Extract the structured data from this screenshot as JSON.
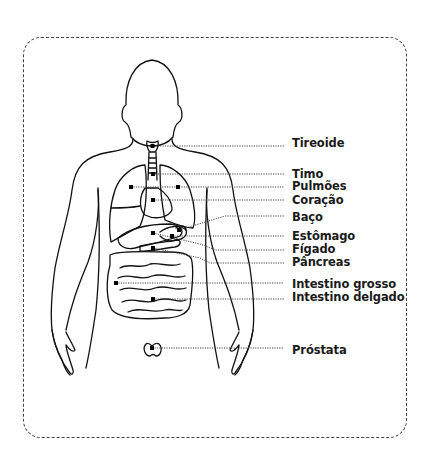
{
  "diagram": {
    "labels": [
      {
        "id": "tireoide",
        "text": "Tireoide"
      },
      {
        "id": "timo",
        "text": "Timo"
      },
      {
        "id": "pulmoes",
        "text": "Pulmões"
      },
      {
        "id": "coracao",
        "text": "Coração"
      },
      {
        "id": "baco",
        "text": "Baço"
      },
      {
        "id": "estomago",
        "text": "Estômago"
      },
      {
        "id": "figado",
        "text": "Fígado"
      },
      {
        "id": "pancreas",
        "text": "Pâncreas"
      },
      {
        "id": "intestino-grosso",
        "text": "Intestino grosso"
      },
      {
        "id": "intestino-delgado",
        "text": "Intestino delgado"
      },
      {
        "id": "prostata",
        "text": "Próstata"
      }
    ]
  }
}
